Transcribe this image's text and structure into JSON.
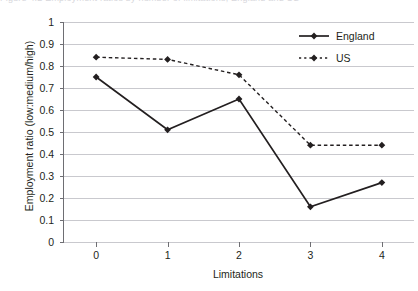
{
  "caption_sliver": "Figure 4.2  Employment ratios by number of limitations, England and US",
  "axes": {
    "ylabel": "Employment ratio (low:medium/high)",
    "xlabel": "Limitations",
    "ytick_labels": [
      "1",
      "0.9",
      "0.8",
      "0.7",
      "0.6",
      "0.5",
      "0.4",
      "0.3",
      "0.2",
      "0.1",
      "0"
    ],
    "xtick_labels": [
      "0",
      "1",
      "2",
      "3",
      "4"
    ]
  },
  "legend": {
    "position": "top-right",
    "items": [
      {
        "label": "England",
        "style": "solid",
        "marker": "diamond",
        "color": "#231f20"
      },
      {
        "label": "US",
        "style": "dotted",
        "marker": "diamond",
        "color": "#231f20"
      }
    ]
  },
  "chart_data": {
    "type": "line",
    "title": "",
    "subtitle": "",
    "xlabel": "Limitations",
    "ylabel": "Employment ratio (low:medium/high)",
    "x": [
      0,
      1,
      2,
      3,
      4
    ],
    "categories": [
      "0",
      "1",
      "2",
      "3",
      "4"
    ],
    "xlim": [
      -0.45,
      4.45
    ],
    "ylim": [
      0,
      1
    ],
    "ytick_values": [
      1,
      0.9,
      0.8,
      0.7,
      0.6,
      0.5,
      0.4,
      0.3,
      0.2,
      0.1,
      0
    ],
    "grid": "horizontal",
    "legend_position": "top-right",
    "series": [
      {
        "name": "England",
        "values": [
          0.75,
          0.51,
          0.65,
          0.16,
          0.27
        ],
        "line_style": "solid",
        "marker": "diamond",
        "color": "#231f20"
      },
      {
        "name": "US",
        "values": [
          0.84,
          0.83,
          0.76,
          0.44,
          0.44
        ],
        "line_style": "dotted",
        "marker": "diamond",
        "color": "#231f20"
      }
    ]
  }
}
